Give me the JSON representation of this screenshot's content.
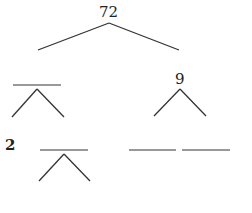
{
  "diagram": {
    "type": "factor-tree",
    "root": "72",
    "nodes": {
      "root_value": "72",
      "right_child_value": "9",
      "left_grandchild_value": "2",
      "blank_left_child": "",
      "blank_lower_factor": "",
      "blank_right_grandchild_1": "",
      "blank_right_grandchild_2": ""
    },
    "line_color": "#333333",
    "blank_color": "#777777"
  }
}
